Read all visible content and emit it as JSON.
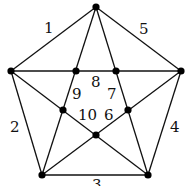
{
  "diagram": {
    "type": "graph",
    "colors": {
      "edge": "#111111",
      "vertex": "#000000",
      "background": "#ffffff"
    },
    "vertices": [
      {
        "id": "top",
        "x": 96,
        "y": 7
      },
      {
        "id": "left",
        "x": 11,
        "y": 71
      },
      {
        "id": "right",
        "x": 181,
        "y": 71
      },
      {
        "id": "bottom-left",
        "x": 42,
        "y": 175
      },
      {
        "id": "bottom-right",
        "x": 148,
        "y": 175
      },
      {
        "id": "inner-upper-left",
        "x": 76,
        "y": 71
      },
      {
        "id": "inner-upper-right",
        "x": 116,
        "y": 71
      },
      {
        "id": "inner-mid-left",
        "x": 63,
        "y": 110
      },
      {
        "id": "inner-mid-right",
        "x": 128,
        "y": 110
      },
      {
        "id": "inner-bottom",
        "x": 96,
        "y": 135
      }
    ],
    "labels": [
      {
        "text": "1",
        "x": 44,
        "y": 33
      },
      {
        "text": "5",
        "x": 139,
        "y": 34
      },
      {
        "text": "2",
        "x": 10,
        "y": 132
      },
      {
        "text": "4",
        "x": 170,
        "y": 132
      },
      {
        "text": "3",
        "x": 92,
        "y": 190
      },
      {
        "text": "8",
        "x": 91,
        "y": 87
      },
      {
        "text": "9",
        "x": 72,
        "y": 99
      },
      {
        "text": "7",
        "x": 107,
        "y": 99
      },
      {
        "text": "10",
        "x": 78,
        "y": 120
      },
      {
        "text": "6",
        "x": 104,
        "y": 120
      }
    ]
  }
}
